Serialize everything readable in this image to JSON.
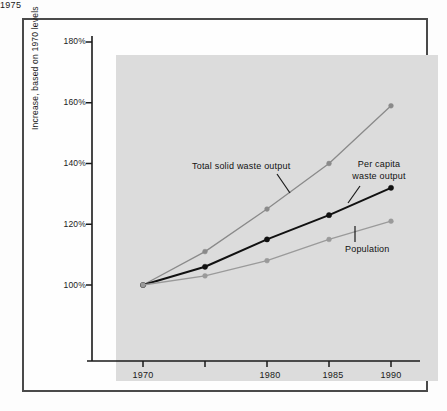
{
  "chart_data": {
    "type": "line",
    "title": "",
    "subtitle": "",
    "xlabel": "",
    "ylabel": "Increase, based on 1970 levels",
    "x": [
      1970,
      1975,
      1980,
      1985,
      1990
    ],
    "xtick_labels": [
      "1970",
      "1975",
      "1980",
      "1985",
      "1990"
    ],
    "ytick_values": [
      100,
      120,
      140,
      160,
      180
    ],
    "ytick_labels": [
      "100%",
      "120%",
      "140%",
      "160%",
      "180%"
    ],
    "xlim": [
      1968.2,
      1991.5
    ],
    "ylim": [
      88,
      182
    ],
    "grid": false,
    "legend_position": "inline-annotations",
    "series": [
      {
        "name": "Total solid waste output",
        "color": "#8a8a8a",
        "marker": "circle",
        "values": [
          100,
          111,
          125,
          140,
          159
        ]
      },
      {
        "name": "Per capita waste output",
        "color": "#111111",
        "marker": "circle",
        "values": [
          100,
          106,
          115,
          123,
          132
        ]
      },
      {
        "name": "Population",
        "color": "#9a9a9a",
        "marker": "circle",
        "values": [
          100,
          103,
          108,
          115,
          121
        ]
      }
    ],
    "annotations": [
      {
        "id": "total-solid-waste-output",
        "text": "Total solid waste output",
        "lines": [
          "Total solid waste output"
        ],
        "points_to_series": "Total solid waste output"
      },
      {
        "id": "per-capita-waste-output",
        "text": "Per capita waste output",
        "lines": [
          "Per capita",
          "waste output"
        ],
        "points_to_series": "Per capita waste output"
      },
      {
        "id": "population",
        "text": "Population",
        "lines": [
          "Population"
        ],
        "points_to_series": "Population"
      }
    ]
  },
  "colors": {
    "panel_background": "#dcdcdc",
    "figure_background": "#fdfdfd",
    "frame_border": "#4a4a4a",
    "axis": "#1a1a1a",
    "text": "#111111",
    "series_total": "#8a8a8a",
    "series_percapita": "#111111",
    "series_population": "#9a9a9a"
  }
}
